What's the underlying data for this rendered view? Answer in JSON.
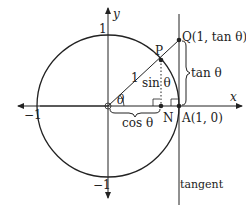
{
  "diagram": {
    "type": "unit-circle-trigonometry",
    "axes": {
      "x_label": "x",
      "y_label": "y",
      "ticks": {
        "x_pos": "",
        "x_neg": "−1",
        "y_pos": "1",
        "y_neg": "−1"
      }
    },
    "points": {
      "origin": {
        "label": ""
      },
      "P": {
        "label": "P"
      },
      "N": {
        "label": "N"
      },
      "A": {
        "label": "A(1, 0)"
      },
      "Q": {
        "label": "Q(1, tan θ)"
      }
    },
    "segment_labels": {
      "radius": "1",
      "angle": "θ",
      "sin": "sin θ",
      "cos": "cos θ",
      "tan": "tan θ"
    },
    "tangent_label": "tangent",
    "colors": {
      "stroke": "#222222",
      "background": "#ffffff"
    }
  }
}
